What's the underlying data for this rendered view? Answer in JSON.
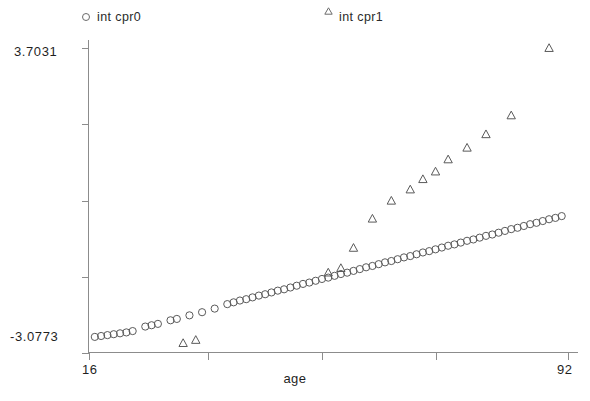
{
  "chart_data": {
    "type": "scatter",
    "title": "",
    "xlabel": "age",
    "ylabel": "",
    "xlim": [
      16,
      92
    ],
    "ylim": [
      -3.0773,
      3.7031
    ],
    "grid": false,
    "legend_position": "top",
    "axis": {
      "x_tick_labels": [
        "16",
        "92"
      ],
      "x_ticks": [
        16,
        35,
        53,
        71,
        92
      ],
      "y_tick_labels": [
        "3.7031",
        "-3.0773"
      ],
      "y_ticks": [
        3.7031,
        2.0,
        0.3,
        -1.4,
        -3.0773
      ]
    },
    "series": [
      {
        "name": "int cpr0",
        "marker": "circle",
        "color": "#5a5a5a",
        "x": [
          17,
          18,
          19,
          20,
          21,
          22,
          23,
          25,
          26,
          27,
          29,
          30,
          32,
          34,
          36,
          38,
          39,
          40,
          41,
          42,
          43,
          44,
          45,
          46,
          47,
          48,
          49,
          50,
          51,
          52,
          53,
          54,
          55,
          56,
          57,
          58,
          59,
          60,
          61,
          62,
          63,
          64,
          65,
          66,
          67,
          68,
          69,
          70,
          71,
          72,
          73,
          74,
          75,
          76,
          77,
          78,
          79,
          80,
          81,
          82,
          83,
          84,
          85,
          86,
          87,
          88,
          89,
          90,
          91
        ],
        "y": [
          -2.73,
          -2.71,
          -2.69,
          -2.67,
          -2.65,
          -2.63,
          -2.6,
          -2.5,
          -2.47,
          -2.44,
          -2.36,
          -2.33,
          -2.25,
          -2.18,
          -2.1,
          -2.0,
          -1.96,
          -1.92,
          -1.89,
          -1.85,
          -1.81,
          -1.78,
          -1.74,
          -1.7,
          -1.67,
          -1.63,
          -1.59,
          -1.55,
          -1.52,
          -1.48,
          -1.44,
          -1.41,
          -1.37,
          -1.33,
          -1.3,
          -1.26,
          -1.22,
          -1.18,
          -1.15,
          -1.11,
          -1.07,
          -1.04,
          -1.0,
          -0.96,
          -0.93,
          -0.89,
          -0.85,
          -0.82,
          -0.78,
          -0.74,
          -0.7,
          -0.67,
          -0.63,
          -0.59,
          -0.56,
          -0.52,
          -0.48,
          -0.45,
          -0.41,
          -0.37,
          -0.33,
          -0.3,
          -0.26,
          -0.22,
          -0.19,
          -0.15,
          -0.11,
          -0.08,
          -0.04
        ]
      },
      {
        "name": "int cpr1",
        "marker": "triangle",
        "color": "#5a5a5a",
        "x": [
          31,
          33,
          54,
          56,
          58,
          61,
          64,
          67,
          69,
          71,
          73,
          76,
          79,
          83,
          89
        ],
        "y": [
          -2.87,
          -2.8,
          -1.3,
          -1.2,
          -0.75,
          -0.1,
          0.3,
          0.55,
          0.78,
          0.95,
          1.22,
          1.48,
          1.78,
          2.2,
          3.7
        ]
      }
    ]
  },
  "legend": {
    "entries": [
      {
        "label": "int cpr0",
        "marker": "circle-marker-icon"
      },
      {
        "label": "int cpr1",
        "marker": "triangle-marker-icon"
      }
    ]
  },
  "axis_labels": {
    "y_top": "3.7031",
    "y_bottom": "-3.0773",
    "x_left": "16",
    "x_right": "92",
    "x_title": "age"
  }
}
